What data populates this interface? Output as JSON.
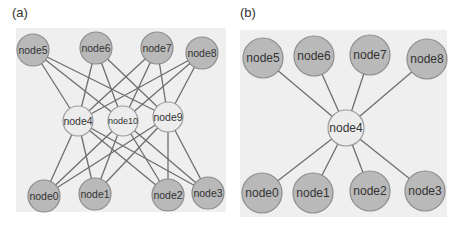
{
  "panels": [
    {
      "label": "(a)",
      "label_pos": [
        12,
        18
      ],
      "box": {
        "x": 16,
        "y": 28,
        "w": 210,
        "h": 184
      },
      "background": "#efefef",
      "node_radius_outer": 16,
      "node_radius_hub": 15,
      "font_size": 10.5,
      "nodes": [
        {
          "id": "node5",
          "x": 33,
          "y": 50,
          "type": "outer"
        },
        {
          "id": "node6",
          "x": 96,
          "y": 48,
          "type": "outer"
        },
        {
          "id": "node7",
          "x": 157,
          "y": 48,
          "type": "outer"
        },
        {
          "id": "node8",
          "x": 202,
          "y": 53,
          "type": "outer"
        },
        {
          "id": "node4",
          "x": 78,
          "y": 121,
          "type": "hub"
        },
        {
          "id": "node10",
          "x": 123,
          "y": 121,
          "type": "hub",
          "font_size": 9
        },
        {
          "id": "node9",
          "x": 168,
          "y": 117,
          "type": "hub"
        },
        {
          "id": "node0",
          "x": 44,
          "y": 196,
          "type": "outer"
        },
        {
          "id": "node1",
          "x": 95,
          "y": 194,
          "type": "outer"
        },
        {
          "id": "node2",
          "x": 168,
          "y": 195,
          "type": "outer"
        },
        {
          "id": "node3",
          "x": 208,
          "y": 193,
          "type": "outer"
        }
      ],
      "edges": [
        [
          "node4",
          "node5"
        ],
        [
          "node4",
          "node6"
        ],
        [
          "node4",
          "node7"
        ],
        [
          "node4",
          "node8"
        ],
        [
          "node4",
          "node0"
        ],
        [
          "node4",
          "node1"
        ],
        [
          "node4",
          "node2"
        ],
        [
          "node4",
          "node3"
        ],
        [
          "node10",
          "node5"
        ],
        [
          "node10",
          "node6"
        ],
        [
          "node10",
          "node7"
        ],
        [
          "node10",
          "node8"
        ],
        [
          "node10",
          "node0"
        ],
        [
          "node10",
          "node1"
        ],
        [
          "node10",
          "node2"
        ],
        [
          "node10",
          "node3"
        ],
        [
          "node9",
          "node5"
        ],
        [
          "node9",
          "node6"
        ],
        [
          "node9",
          "node7"
        ],
        [
          "node9",
          "node8"
        ],
        [
          "node9",
          "node0"
        ],
        [
          "node9",
          "node1"
        ],
        [
          "node9",
          "node2"
        ],
        [
          "node9",
          "node3"
        ]
      ]
    },
    {
      "label": "(b)",
      "label_pos": [
        240,
        18
      ],
      "box": {
        "x": 240,
        "y": 30,
        "w": 207,
        "h": 187
      },
      "background": "#efefef",
      "node_radius_outer": 20,
      "node_radius_hub": 18,
      "font_size": 12,
      "nodes": [
        {
          "id": "node5",
          "x": 263,
          "y": 58,
          "type": "outer"
        },
        {
          "id": "node6",
          "x": 314,
          "y": 56,
          "type": "outer"
        },
        {
          "id": "node7",
          "x": 370,
          "y": 55,
          "type": "outer"
        },
        {
          "id": "node8",
          "x": 427,
          "y": 59,
          "type": "outer"
        },
        {
          "id": "node4",
          "x": 346,
          "y": 128,
          "type": "hub"
        },
        {
          "id": "node0",
          "x": 262,
          "y": 193,
          "type": "outer"
        },
        {
          "id": "node1",
          "x": 313,
          "y": 193,
          "type": "outer"
        },
        {
          "id": "node2",
          "x": 370,
          "y": 191,
          "type": "outer"
        },
        {
          "id": "node3",
          "x": 425,
          "y": 191,
          "type": "outer"
        }
      ],
      "edges": [
        [
          "node4",
          "node5"
        ],
        [
          "node4",
          "node6"
        ],
        [
          "node4",
          "node7"
        ],
        [
          "node4",
          "node8"
        ],
        [
          "node4",
          "node0"
        ],
        [
          "node4",
          "node1"
        ],
        [
          "node4",
          "node2"
        ],
        [
          "node4",
          "node3"
        ]
      ]
    }
  ],
  "colors": {
    "panel_bg": "#efefef",
    "outer_node_fill": "#b9b9b9",
    "outer_node_stroke": "#8c8c8c",
    "hub_node_fill": "#ececec",
    "hub_node_stroke": "#9a9a9a",
    "edge": "#6e6e6e",
    "text": "#333333"
  }
}
